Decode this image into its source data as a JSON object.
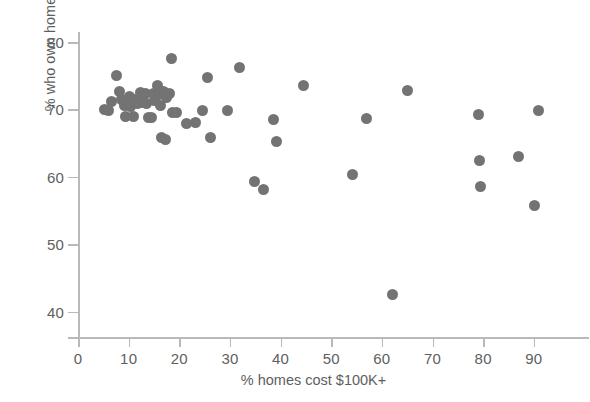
{
  "chart_data": {
    "type": "scatter",
    "title": "",
    "xlabel": "% homes cost $100K+",
    "ylabel": "% who own home",
    "xlim": [
      0,
      93
    ],
    "ylim": [
      38,
      81.5
    ],
    "xticks": [
      0,
      10,
      20,
      30,
      40,
      50,
      60,
      70,
      80,
      90
    ],
    "yticks": [
      40,
      50,
      60,
      70,
      80
    ],
    "xtick_labels": [
      "0",
      "10",
      "20",
      "30",
      "40",
      "50",
      "60",
      "70",
      "80",
      "90"
    ],
    "ytick_labels": [
      "40",
      "50",
      "60",
      "70",
      "80"
    ],
    "grid": false,
    "legend": null,
    "marker": {
      "shape": "circle",
      "color": "#737373",
      "size_px": 11
    },
    "series": [
      {
        "name": "states",
        "points": [
          {
            "x": 5.2,
            "y": 70.0
          },
          {
            "x": 6.1,
            "y": 69.8
          },
          {
            "x": 6.6,
            "y": 71.2
          },
          {
            "x": 7.6,
            "y": 75.0
          },
          {
            "x": 8.2,
            "y": 72.6
          },
          {
            "x": 8.6,
            "y": 71.5
          },
          {
            "x": 9.2,
            "y": 70.6
          },
          {
            "x": 9.4,
            "y": 68.9
          },
          {
            "x": 10.1,
            "y": 71.9
          },
          {
            "x": 10.3,
            "y": 70.4
          },
          {
            "x": 10.9,
            "y": 68.9
          },
          {
            "x": 11.3,
            "y": 71.5
          },
          {
            "x": 11.8,
            "y": 70.9
          },
          {
            "x": 12.4,
            "y": 72.5
          },
          {
            "x": 12.8,
            "y": 71.0
          },
          {
            "x": 13.3,
            "y": 72.3
          },
          {
            "x": 13.6,
            "y": 70.9
          },
          {
            "x": 14.0,
            "y": 68.8
          },
          {
            "x": 14.6,
            "y": 68.8
          },
          {
            "x": 14.9,
            "y": 72.4
          },
          {
            "x": 15.2,
            "y": 71.4
          },
          {
            "x": 15.6,
            "y": 73.6
          },
          {
            "x": 15.9,
            "y": 72.2
          },
          {
            "x": 16.2,
            "y": 70.6
          },
          {
            "x": 16.5,
            "y": 65.8
          },
          {
            "x": 16.9,
            "y": 72.6
          },
          {
            "x": 17.2,
            "y": 65.5
          },
          {
            "x": 17.5,
            "y": 71.8
          },
          {
            "x": 18.0,
            "y": 72.3
          },
          {
            "x": 18.4,
            "y": 77.5
          },
          {
            "x": 18.6,
            "y": 69.6
          },
          {
            "x": 19.5,
            "y": 69.5
          },
          {
            "x": 21.4,
            "y": 67.9
          },
          {
            "x": 23.2,
            "y": 68.0
          },
          {
            "x": 24.6,
            "y": 69.8
          },
          {
            "x": 25.6,
            "y": 74.7
          },
          {
            "x": 26.1,
            "y": 65.8
          },
          {
            "x": 29.6,
            "y": 69.9
          },
          {
            "x": 31.9,
            "y": 76.2
          },
          {
            "x": 34.8,
            "y": 59.3
          },
          {
            "x": 36.6,
            "y": 58.1
          },
          {
            "x": 38.7,
            "y": 68.5
          },
          {
            "x": 39.1,
            "y": 65.3
          },
          {
            "x": 44.6,
            "y": 73.6
          },
          {
            "x": 54.2,
            "y": 60.3
          },
          {
            "x": 56.9,
            "y": 68.6
          },
          {
            "x": 62.1,
            "y": 42.6
          },
          {
            "x": 65.0,
            "y": 72.8
          },
          {
            "x": 79.1,
            "y": 69.3
          },
          {
            "x": 79.3,
            "y": 62.4
          },
          {
            "x": 79.4,
            "y": 58.6
          },
          {
            "x": 86.9,
            "y": 63.0
          },
          {
            "x": 90.2,
            "y": 55.8
          },
          {
            "x": 90.9,
            "y": 69.9
          }
        ]
      }
    ]
  }
}
